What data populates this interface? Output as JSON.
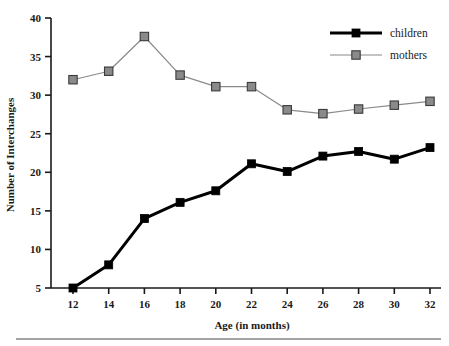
{
  "chart_data": {
    "type": "line",
    "title": "",
    "xlabel": "Age (in months)",
    "ylabel": "Number of Interchanges",
    "x": [
      12,
      14,
      16,
      18,
      20,
      22,
      24,
      26,
      28,
      30,
      32
    ],
    "xticklabels": [
      "12",
      "14",
      "16",
      "18",
      "20",
      "22",
      "24",
      "26",
      "28",
      "30",
      "32"
    ],
    "yticks": [
      5,
      10,
      15,
      20,
      25,
      30,
      35,
      40
    ],
    "yticklabels": [
      "5",
      "10",
      "15",
      "20",
      "25",
      "30",
      "35",
      "40"
    ],
    "xlim": [
      11,
      33
    ],
    "ylim": [
      5,
      40
    ],
    "grid": false,
    "legend_position": "top-right",
    "series": [
      {
        "name": "children",
        "color": "#000000",
        "marker": "square-filled",
        "linewidth": 3,
        "values": [
          5.0,
          8.0,
          14.0,
          16.1,
          17.6,
          21.1,
          20.1,
          22.1,
          22.7,
          21.7,
          23.2
        ]
      },
      {
        "name": "mothers",
        "color": "#8a8a8a",
        "marker": "square-filled",
        "linewidth": 1.2,
        "values": [
          32.0,
          33.1,
          37.6,
          32.6,
          31.1,
          31.1,
          28.1,
          27.6,
          28.2,
          28.7,
          29.2
        ]
      }
    ]
  },
  "legend": {
    "entries": [
      {
        "label": "children"
      },
      {
        "label": "mothers"
      }
    ]
  },
  "colors": {
    "children": "#000000",
    "mothers": "#8a8a8a",
    "axis": "#1a1a1a",
    "background": "#ffffff",
    "rule": "#4a4a4a"
  }
}
